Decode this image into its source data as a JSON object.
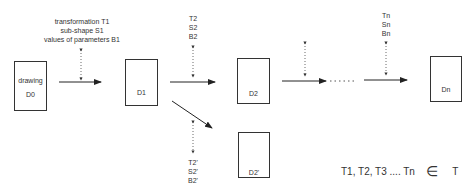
{
  "diagram": {
    "boxes": [
      {
        "id": "D0",
        "line1": "drawing",
        "line2": "D0"
      },
      {
        "id": "D1",
        "label": "D1"
      },
      {
        "id": "D2",
        "label": "D2"
      },
      {
        "id": "D2p",
        "label": "D2'"
      },
      {
        "id": "Dn",
        "label": "Dn"
      }
    ],
    "annotations": {
      "step1": [
        "transformation T1",
        "sub-shape S1",
        "values of parameters B1"
      ],
      "step2": [
        "T2",
        "S2",
        "B2"
      ],
      "step2p": [
        "T2'",
        "S2'",
        "B2'"
      ],
      "stepn": [
        "Tn",
        "Sn",
        "Bn"
      ]
    },
    "formula": {
      "left": "T1, T2, T3 .... Tn",
      "symbol": "∈",
      "right": "T"
    }
  }
}
